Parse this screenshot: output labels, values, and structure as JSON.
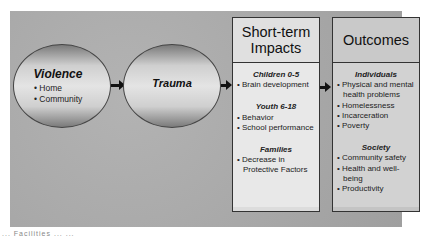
{
  "circles": [
    {
      "title": "Violence",
      "items": [
        "Home",
        "Community"
      ]
    },
    {
      "title": "Trauma"
    }
  ],
  "boxes": {
    "short_term": {
      "title_line1": "Short-term",
      "title_line2": "Impacts",
      "groups": [
        {
          "title": "Children 0-5",
          "items": [
            "Brain development"
          ]
        },
        {
          "title": "Youth 6-18",
          "items": [
            "Behavior",
            "School performance"
          ]
        },
        {
          "title": "Families",
          "items": [
            "Decrease in Protective Factors"
          ]
        }
      ]
    },
    "outcomes": {
      "title": "Outcomes",
      "groups": [
        {
          "title": "Individuals",
          "items": [
            "Physical and mental health problems",
            "Homelessness",
            "Incarceration",
            "Poverty"
          ]
        },
        {
          "title": "Society",
          "items": [
            "Community safety",
            "Health and well-being",
            "Productivity"
          ]
        }
      ]
    }
  },
  "caption": "... Facilities ... ..."
}
